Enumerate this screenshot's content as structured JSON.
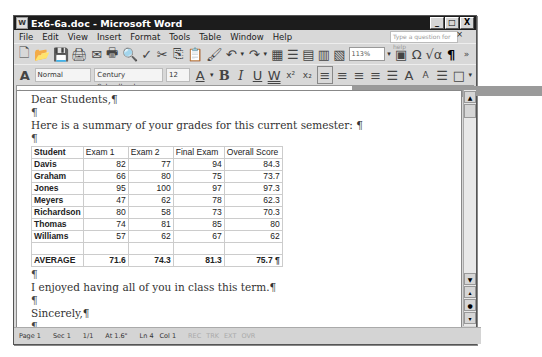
{
  "window": {
    "title": "Ex6-6a.doc - Microsoft Word",
    "controls": [
      "_",
      "□",
      "X"
    ]
  },
  "menubar": {
    "items": [
      "File",
      "Edit",
      "View",
      "Insert",
      "Format",
      "Tools",
      "Table",
      "Window",
      "Help"
    ],
    "help_placeholder": "Type a question for help",
    "close": "×"
  },
  "standard_toolbar": {
    "zoom": "113%",
    "icons": [
      "new-icon",
      "open-icon",
      "save-icon",
      "permission-icon",
      "email-icon",
      "print-icon",
      "print-preview-icon",
      "spelling-icon",
      "cut-icon",
      "copy-icon",
      "paste-icon",
      "format-painter-icon",
      "undo-icon",
      "redo-icon",
      "tables-icon",
      "insert-table-icon",
      "insert-excel-icon",
      "columns-icon",
      "drawing-icon",
      "document-map-icon",
      "omega-icon",
      "equation-icon",
      "show-hide-icon"
    ]
  },
  "formatting_toolbar": {
    "style": "Normal",
    "font": "Century Schoolbook",
    "size": "12",
    "buttons": {
      "bold": "B",
      "italic": "I",
      "underline": "U",
      "double_underline": "W",
      "superscript": "x²",
      "subscript": "x₂"
    }
  },
  "document": {
    "greeting": "Dear Students,¶",
    "blank": "¶",
    "intro": "Here is a summary of your grades for this current semester: ¶",
    "table": {
      "headers": [
        "Student",
        "Exam 1",
        "Exam 2",
        "Final Exam",
        "Overall Score"
      ],
      "rows": [
        [
          "Davis",
          "82",
          "77",
          "94",
          "84.3"
        ],
        [
          "Graham",
          "66",
          "80",
          "75",
          "73.7"
        ],
        [
          "Jones",
          "95",
          "100",
          "97",
          "97.3"
        ],
        [
          "Meyers",
          "47",
          "62",
          "78",
          "62.3"
        ],
        [
          "Richardson",
          "80",
          "58",
          "73",
          "70.3"
        ],
        [
          "Thomas",
          "74",
          "81",
          "85",
          "80"
        ],
        [
          "Williams",
          "57",
          "62",
          "67",
          "62"
        ],
        [
          "",
          "",
          "",
          "",
          ""
        ]
      ],
      "average": [
        "AVERAGE",
        "71.6",
        "74.3",
        "81.3",
        "75.7 ¶"
      ]
    },
    "closing_line": "I enjoyed having all of you in class this term.¶",
    "signoff": "Sincerely,¶",
    "signature": "Prof. I. M. Boehring¶"
  },
  "statusbar": {
    "page": "Page 1",
    "section": "Sec 1",
    "pages": "1/1",
    "at": "At 1.6\"",
    "line": "Ln 4",
    "col": "Col 1",
    "modes": [
      "REC",
      "TRK",
      "EXT",
      "OVR"
    ]
  }
}
